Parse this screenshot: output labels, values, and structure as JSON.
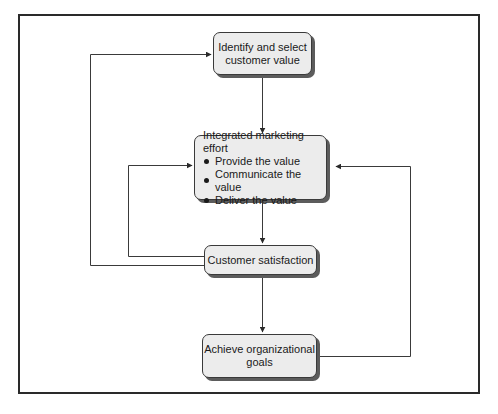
{
  "diagram": {
    "type": "flowchart",
    "nodes": {
      "identify": {
        "line1": "Identify and select",
        "line2": "customer value"
      },
      "integrated": {
        "title": "Integrated marketing effort",
        "bullets": [
          "Provide the value",
          "Communicate the value",
          "Deliver the value"
        ]
      },
      "satisfaction": {
        "label": "Customer satisfaction"
      },
      "goals": {
        "line1": "Achieve organizational",
        "line2": "goals"
      }
    },
    "edges": [
      {
        "from": "Identify and select customer value",
        "to": "Integrated marketing effort"
      },
      {
        "from": "Integrated marketing effort",
        "to": "Customer satisfaction"
      },
      {
        "from": "Customer satisfaction",
        "to": "Achieve organizational goals"
      },
      {
        "from": "Customer satisfaction",
        "to": "Identify and select customer value",
        "style": "feedback loop (left, outer)"
      },
      {
        "from": "Customer satisfaction",
        "to": "Integrated marketing effort",
        "style": "feedback loop (left, inner)"
      },
      {
        "from": "Achieve organizational goals",
        "to": "Integrated marketing effort",
        "style": "feedback loop (right)"
      }
    ],
    "colors": {
      "node_fill": "#ececec",
      "node_border": "#3a3a3a",
      "node_shadow": "#5c5c5c",
      "line": "#3a3a3a",
      "frame": "#2a2a2a"
    }
  }
}
